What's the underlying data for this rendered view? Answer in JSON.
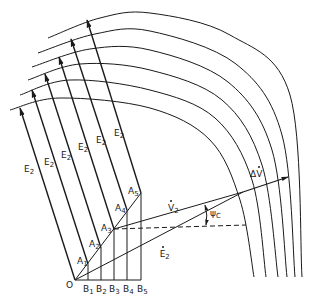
{
  "diagram": {
    "type": "vector-construction",
    "stroke_color": "#1a1a1a",
    "origin": {
      "label": "O",
      "x": 75,
      "y": 280
    },
    "base_points": [
      {
        "label": "B1",
        "x": 88,
        "y": 280
      },
      {
        "label": "B2",
        "x": 101,
        "y": 280
      },
      {
        "label": "B3",
        "x": 114,
        "y": 280
      },
      {
        "label": "B4",
        "x": 127,
        "y": 280
      },
      {
        "label": "B5",
        "x": 141,
        "y": 280
      }
    ],
    "a_points": [
      {
        "label": "A1",
        "x": 88,
        "y": 264
      },
      {
        "label": "A2",
        "x": 101,
        "y": 248
      },
      {
        "label": "A3",
        "x": 114,
        "y": 229
      },
      {
        "label": "A4",
        "x": 127,
        "y": 210
      },
      {
        "label": "A5",
        "x": 141,
        "y": 193
      }
    ],
    "e2_vectors": [
      {
        "from": [
          75,
          280
        ],
        "to": [
          20,
          108
        ],
        "label": "E2",
        "label_pos": [
          24,
          165
        ]
      },
      {
        "from": [
          88,
          264
        ],
        "to": [
          32,
          90
        ],
        "label": "E2",
        "label_pos": [
          44,
          158
        ]
      },
      {
        "from": [
          101,
          248
        ],
        "to": [
          45,
          74
        ],
        "label": "E2",
        "label_pos": [
          61,
          151
        ]
      },
      {
        "from": [
          114,
          229
        ],
        "to": [
          59,
          57
        ],
        "label": "E2",
        "label_pos": [
          78,
          143
        ]
      },
      {
        "from": [
          127,
          210
        ],
        "to": [
          71,
          39
        ],
        "label": "E2",
        "label_pos": [
          96,
          136
        ]
      },
      {
        "from": [
          141,
          193
        ],
        "to": [
          87,
          20
        ],
        "label": "E2",
        "label_pos": [
          114,
          129
        ]
      }
    ],
    "arcs": [
      [
        [
          10,
          110
        ],
        [
          60,
          98
        ],
        [
          150,
          108
        ],
        [
          210,
          140
        ],
        [
          240,
          200
        ],
        [
          254,
          277
        ]
      ],
      [
        [
          20,
          95
        ],
        [
          70,
          80
        ],
        [
          150,
          90
        ],
        [
          215,
          118
        ],
        [
          252,
          180
        ],
        [
          266,
          277
        ]
      ],
      [
        [
          28,
          80
        ],
        [
          80,
          64
        ],
        [
          150,
          70
        ],
        [
          222,
          100
        ],
        [
          262,
          165
        ],
        [
          278,
          277
        ]
      ],
      [
        [
          32,
          67
        ],
        [
          90,
          49
        ],
        [
          150,
          50
        ],
        [
          228,
          82
        ],
        [
          272,
          150
        ],
        [
          287,
          277
        ]
      ],
      [
        [
          38,
          53
        ],
        [
          95,
          34
        ],
        [
          150,
          31
        ],
        [
          236,
          64
        ],
        [
          282,
          135
        ],
        [
          295,
          277
        ]
      ],
      [
        [
          48,
          38
        ],
        [
          100,
          18
        ],
        [
          150,
          13
        ],
        [
          230,
          35
        ],
        [
          290,
          95
        ],
        [
          302,
          277
        ]
      ]
    ],
    "v2_line": {
      "from": [
        114,
        229
      ],
      "to": [
        243,
        192
      ],
      "label": "V2",
      "label_pos": [
        168,
        197
      ]
    },
    "e2_dot_line": {
      "from": [
        75,
        280
      ],
      "to": [
        243,
        192
      ],
      "label": "E2",
      "label_pos": [
        145,
        243
      ]
    },
    "delta_v": {
      "from": [
        243,
        192
      ],
      "to": [
        288,
        177
      ],
      "label": "ΔV",
      "label_pos": [
        250,
        170
      ]
    },
    "dashed_line": {
      "from": [
        114,
        229
      ],
      "to": [
        246,
        225
      ]
    },
    "angle": {
      "label": "ψc",
      "label_pos": [
        210,
        209
      ],
      "arc_from": [
        205,
        205
      ],
      "arc_to": [
        206,
        225
      ]
    }
  }
}
